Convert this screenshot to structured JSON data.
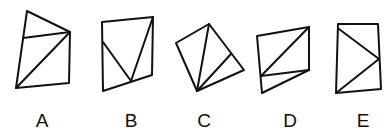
{
  "figures": [
    {
      "label": "A",
      "outline": [
        [
          27,
          11
        ],
        [
          70,
          32
        ],
        [
          69,
          83
        ],
        [
          16,
          88
        ]
      ],
      "lines": [
        [
          [
            23,
            38
          ],
          [
            70,
            32
          ]
        ],
        [
          [
            16,
            88
          ],
          [
            70,
            32
          ]
        ]
      ],
      "label_pos": [
        42,
        127
      ]
    },
    {
      "label": "B",
      "outline": [
        [
          102,
          22
        ],
        [
          153,
          17
        ],
        [
          152,
          75
        ],
        [
          103,
          91
        ]
      ],
      "lines": [
        [
          [
            103,
            42
          ],
          [
            131,
            81
          ]
        ],
        [
          [
            131,
            81
          ],
          [
            153,
            17
          ]
        ]
      ],
      "label_pos": [
        131,
        127
      ]
    },
    {
      "label": "C",
      "outline": [
        [
          176,
          43
        ],
        [
          209,
          24
        ],
        [
          244,
          70
        ],
        [
          197,
          91
        ]
      ],
      "lines": [
        [
          [
            197,
            91
          ],
          [
            209,
            24
          ]
        ],
        [
          [
            197,
            91
          ],
          [
            231,
            54
          ]
        ]
      ],
      "label_pos": [
        204,
        127
      ]
    },
    {
      "label": "D",
      "outline": [
        [
          257,
          36
        ],
        [
          309,
          27
        ],
        [
          309,
          70
        ],
        [
          262,
          93
        ]
      ],
      "lines": [
        [
          [
            261,
            76
          ],
          [
            309,
            27
          ]
        ],
        [
          [
            261,
            76
          ],
          [
            309,
            70
          ]
        ]
      ],
      "label_pos": [
        290,
        127
      ]
    },
    {
      "label": "E",
      "outline": [
        [
          338,
          24
        ],
        [
          378,
          24
        ],
        [
          381,
          89
        ],
        [
          336,
          93
        ]
      ],
      "lines": [
        [
          [
            339,
            29
          ],
          [
            379,
            59
          ]
        ],
        [
          [
            336,
            93
          ],
          [
            379,
            59
          ]
        ]
      ],
      "label_pos": [
        363,
        127
      ]
    }
  ],
  "style": {
    "stroke_color": "#111111",
    "background": "#ffffff"
  }
}
